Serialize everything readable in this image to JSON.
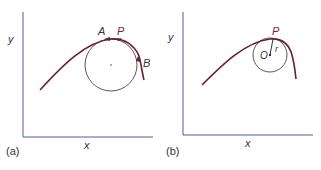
{
  "panels": [
    {
      "id": "a",
      "caption": "(a)",
      "xlabel": "x",
      "ylabel": "y",
      "points": {
        "A": "A",
        "P": "P",
        "B": "B"
      },
      "description": "Curve with osculating circle touching at P between points A and B"
    },
    {
      "id": "b",
      "caption": "(b)",
      "xlabel": "x",
      "ylabel": "y",
      "points": {
        "P": "P",
        "O": "O",
        "r": "r"
      },
      "description": "Curve with circle of curvature at P, center O and radius r"
    }
  ],
  "colors": {
    "curve": "#6b1e2e",
    "axes": "#4a5fa8",
    "circle": "#444444",
    "point_label_P": "#7a1f33",
    "text": "#333333"
  }
}
